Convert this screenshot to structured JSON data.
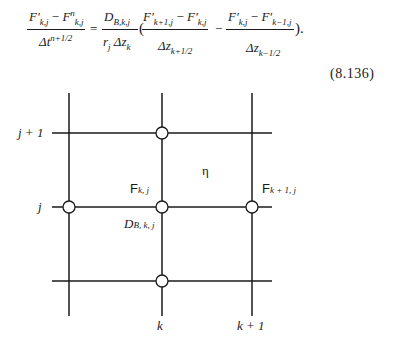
{
  "equation": {
    "lhs": {
      "numerator": {
        "t1": "F′",
        "t1_sub": "k,j",
        "op": " − ",
        "t2": "F",
        "t2_sup": "n",
        "t2_sub": "k,j"
      },
      "denominator": {
        "t": "Δt",
        "sup": "n+1/2"
      }
    },
    "equals": "=",
    "coef": {
      "numerator": {
        "t": "D",
        "sub": "B,k,j"
      },
      "denominator": {
        "t1": "r",
        "t1_sub": "j",
        "t2": " Δz",
        "t2_sub": "k"
      }
    },
    "open_paren": "(",
    "term1": {
      "numerator": {
        "t1": "F′",
        "t1_sub": "k+1,j",
        "op": " − ",
        "t2": "F′",
        "t2_sub": "k,j"
      },
      "denominator": {
        "t": "Δz",
        "sub": "k+1/2"
      }
    },
    "minus": "−",
    "term2": {
      "numerator": {
        "t1": "F′",
        "t1_sub": "k,j",
        "op": " − ",
        "t2": "F′",
        "t2_sub": "k−1,j"
      },
      "denominator": {
        "t": "Δz",
        "sub": "k−1/2"
      }
    },
    "close": ")."
  },
  "equation_number": "(8.136)",
  "diagram": {
    "row_labels": [
      "j + 1",
      "j"
    ],
    "col_labels": [
      "k",
      "k + 1"
    ],
    "node_labels": {
      "f_center": {
        "t": "F",
        "sub": "k, j"
      },
      "f_right": {
        "t": "F",
        "sub": "k + 1, j"
      },
      "d_center": {
        "t": "D",
        "sub": "B, k, j"
      },
      "eta": "η"
    },
    "colors": {
      "line": "#1a1a1a",
      "node_fill": "#ffffff"
    }
  }
}
